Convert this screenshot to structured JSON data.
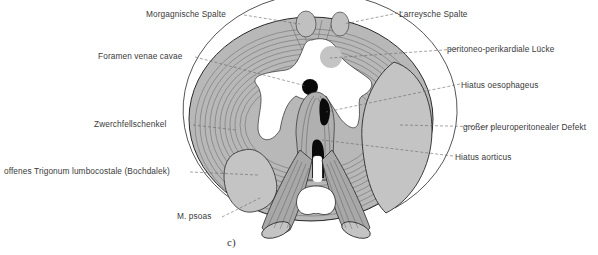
{
  "figure": {
    "caption": "c)",
    "colors": {
      "muscle_fill": "#b8b8b8",
      "defect_fill": "#c4c4c4",
      "outline": "#2a2a2a",
      "label_text": "#3a3a3a",
      "leader_line": "#666666"
    }
  },
  "labels": {
    "left": [
      {
        "id": "morgagni",
        "text": "Morgagnische Spalte"
      },
      {
        "id": "foramen",
        "text": "Foramen venae cavae"
      },
      {
        "id": "zwerchfellschenkel",
        "text": "Zwerchfellschenkel"
      },
      {
        "id": "bochdalek",
        "text": "offenes Trigonum lumbocostale (Bochdalek)"
      },
      {
        "id": "psoas",
        "text": "M. psoas"
      }
    ],
    "right": [
      {
        "id": "larrey",
        "text": "Larreysche Spalte"
      },
      {
        "id": "peritoneo",
        "text": "peritoneo-perikardiale Lücke"
      },
      {
        "id": "oesophageus",
        "text": "Hiatus oesophageus"
      },
      {
        "id": "defekt",
        "text": "großer pleuroperitonealer Defekt"
      },
      {
        "id": "aorticus",
        "text": "Hiatus aorticus"
      }
    ]
  }
}
